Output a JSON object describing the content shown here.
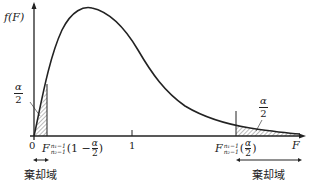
{
  "diagram": {
    "type": "F-distribution two-tailed rejection regions",
    "y_axis_label": "f(F)",
    "x_axis_label": "F",
    "origin_label": "0",
    "tick_one_label": "1",
    "left_tail": {
      "area_num": "α",
      "area_den": "2",
      "critical_value": {
        "base": "F",
        "sup": "n₁−1",
        "sub": "n₂−1",
        "arg_prefix": "(1 − ",
        "arg_num": "α",
        "arg_den": "2",
        "arg_suffix": ")"
      },
      "region_label": "棄却域"
    },
    "right_tail": {
      "area_num": "α",
      "area_den": "2",
      "critical_value": {
        "base": "F",
        "sup": "n₁−1",
        "sub": "n₂−1",
        "arg_prefix": "(",
        "arg_num": "α",
        "arg_den": "2",
        "arg_suffix": ")"
      },
      "region_label": "棄却域"
    },
    "colors": {
      "line": "#222222",
      "hatch": "#555555",
      "background": "#ffffff"
    }
  }
}
